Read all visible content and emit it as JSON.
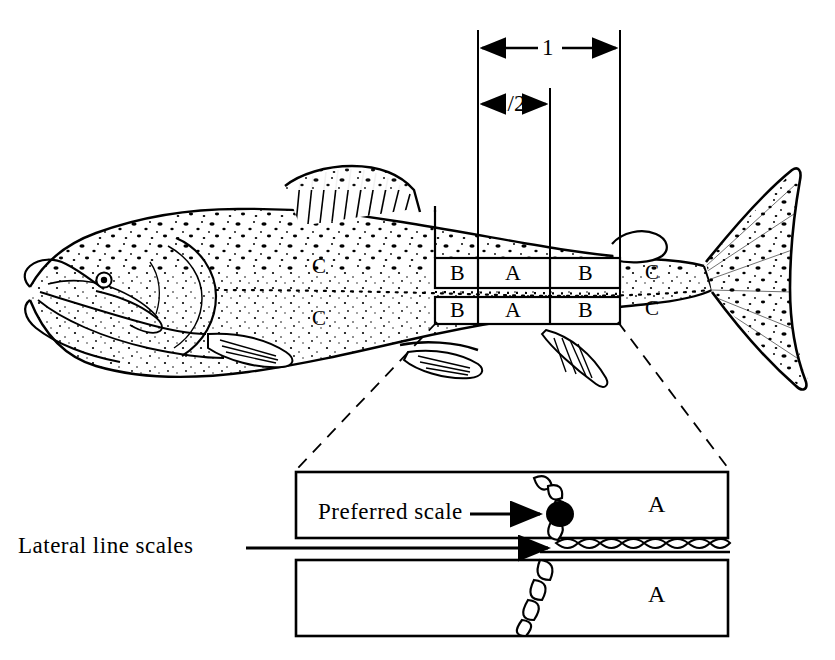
{
  "figure": {
    "dimensions": {
      "full": "1",
      "half": "1/2"
    },
    "grid_rows": [
      {
        "cells": [
          "B",
          "A",
          "B"
        ]
      },
      {
        "cells": [
          "B",
          "A",
          "B"
        ]
      }
    ],
    "body_regions": {
      "upper_front": "C",
      "lower_front": "C",
      "upper_rear": "C",
      "lower_rear": "C"
    },
    "detail_panel": {
      "upper_box_label": "A",
      "lower_box_label": "A",
      "preferred_scale_label": "Preferred  scale",
      "lateral_line_label": "Lateral  line  scales"
    },
    "colors": {
      "ink": "#000000",
      "background": "#ffffff"
    }
  }
}
